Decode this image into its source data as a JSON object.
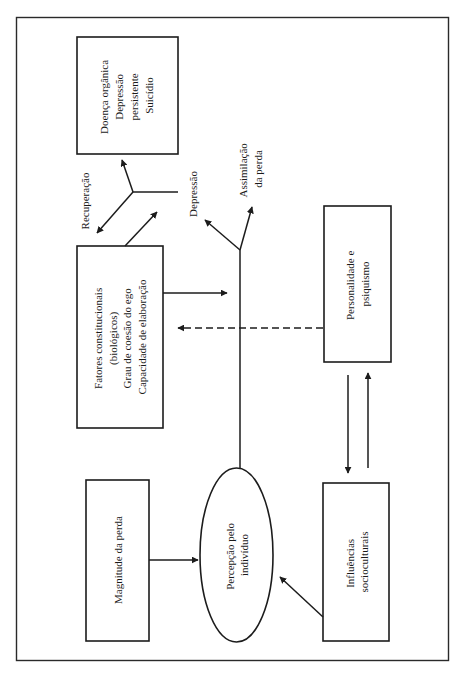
{
  "diagram": {
    "nodes": {
      "doenca": {
        "shape": "rectangle",
        "lines": [
          "Doença orgânica",
          "Depressão",
          "persistente",
          "Suicídio"
        ]
      },
      "fatores": {
        "shape": "rectangle",
        "lines": [
          "Fatores constitucionais",
          "(biológicos)",
          "Grau de coesão do ego",
          "Capacidade de elaboração"
        ]
      },
      "personalidade": {
        "shape": "rectangle",
        "lines": [
          "Personalidade e",
          "psiquismo"
        ]
      },
      "magnitude": {
        "shape": "rectangle",
        "lines": [
          "Magnitude da perda"
        ]
      },
      "percepcao": {
        "shape": "ellipse",
        "lines": [
          "Percepção pelo",
          "indivíduo"
        ]
      },
      "influencias": {
        "shape": "rectangle",
        "lines": [
          "Influências",
          "socioculturais"
        ]
      }
    },
    "branch_labels": {
      "recuperacao": "Recuperação",
      "depressao": "Depressão",
      "assimilacao": [
        "Assimilação",
        "da perda"
      ]
    },
    "edges": [
      {
        "from": "magnitude",
        "to": "percepcao",
        "style": "solid"
      },
      {
        "from": "influencias",
        "to": "percepcao",
        "style": "solid"
      },
      {
        "from": "personalidade",
        "to": "influencias",
        "style": "solid"
      },
      {
        "from": "influencias",
        "to": "personalidade",
        "style": "solid"
      },
      {
        "from": "percepcao",
        "to": "branch-point",
        "style": "solid"
      },
      {
        "from": "fatores",
        "to": "branch-point",
        "style": "solid"
      },
      {
        "from": "personalidade",
        "to": "fatores",
        "style": "dashed"
      },
      {
        "from": "branch-point",
        "to": "depressao",
        "style": "solid"
      },
      {
        "from": "branch-point",
        "to": "assimilacao",
        "style": "solid"
      },
      {
        "from": "fatores",
        "to": "depressao",
        "style": "solid"
      },
      {
        "from": "depressao",
        "to": "recuperacao",
        "style": "solid"
      },
      {
        "from": "depressao",
        "to": "doenca",
        "style": "solid"
      }
    ],
    "text_orientation": "rotated -90deg"
  }
}
